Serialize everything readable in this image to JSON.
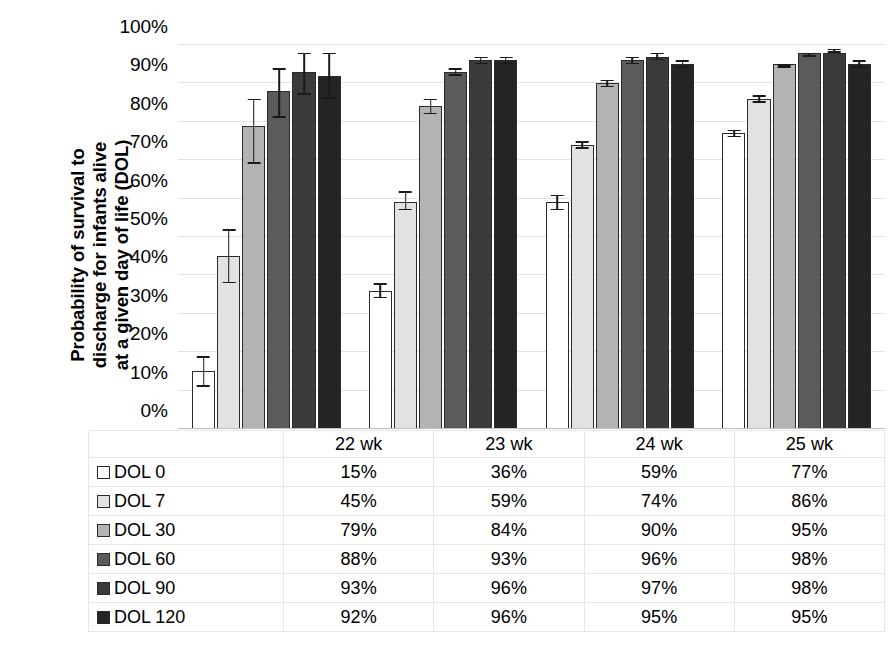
{
  "chart_data": {
    "type": "bar",
    "title": "",
    "xlabel": "",
    "ylabel": "Probability of survival to discharge for infants alive at a given day of life (DOL)",
    "ylabel_lines": [
      "Probability of survival to",
      "discharge for infants alive",
      "at a given day of life (DOL)"
    ],
    "categories": [
      "22 wk",
      "23 wk",
      "24 wk",
      "25 wk"
    ],
    "ylim": [
      0,
      100
    ],
    "y_unit": "%",
    "y_ticks": [
      0,
      10,
      20,
      30,
      40,
      50,
      60,
      70,
      80,
      90,
      100
    ],
    "y_tick_labels": [
      "0%",
      "10%",
      "20%",
      "30%",
      "40%",
      "50%",
      "60%",
      "70%",
      "80%",
      "90%",
      "100%"
    ],
    "grid": true,
    "legend_position": "table-left-column",
    "error_bars": "95% confidence interval",
    "series": [
      {
        "name": "DOL 0",
        "color": "#ffffff",
        "values": [
          15,
          36,
          59,
          77
        ],
        "labels": [
          "15%",
          "36%",
          "59%",
          "77%"
        ],
        "ci_low": [
          11,
          34,
          57,
          76
        ],
        "ci_high": [
          19,
          38,
          61,
          78
        ]
      },
      {
        "name": "DOL 7",
        "color": "#e2e2e2",
        "values": [
          45,
          59,
          74,
          86
        ],
        "labels": [
          "45%",
          "59%",
          "74%",
          "86%"
        ],
        "ci_low": [
          38,
          57,
          73,
          85
        ],
        "ci_high": [
          52,
          62,
          75,
          87
        ]
      },
      {
        "name": "DOL 30",
        "color": "#b3b3b3",
        "values": [
          79,
          84,
          90,
          95
        ],
        "labels": [
          "79%",
          "84%",
          "90%",
          "95%"
        ],
        "ci_low": [
          69,
          82,
          89,
          94
        ],
        "ci_high": [
          86,
          86,
          91,
          95
        ]
      },
      {
        "name": "DOL 60",
        "color": "#5b5b5b",
        "values": [
          88,
          93,
          96,
          98
        ],
        "labels": [
          "88%",
          "93%",
          "96%",
          "98%"
        ],
        "ci_low": [
          81,
          92,
          95,
          97
        ],
        "ci_high": [
          94,
          94,
          97,
          98
        ]
      },
      {
        "name": "DOL 90",
        "color": "#3b3b3b",
        "values": [
          93,
          96,
          97,
          98
        ],
        "labels": [
          "93%",
          "96%",
          "97%",
          "98%"
        ],
        "ci_low": [
          87,
          95,
          96,
          98
        ],
        "ci_high": [
          98,
          97,
          98,
          99
        ]
      },
      {
        "name": "DOL 120",
        "color": "#242424",
        "values": [
          92,
          96,
          95,
          95
        ],
        "labels": [
          "92%",
          "96%",
          "95%",
          "95%"
        ],
        "ci_low": [
          86,
          95,
          94,
          94
        ],
        "ci_high": [
          98,
          97,
          96,
          96
        ]
      }
    ]
  },
  "table": {
    "corner_label": "",
    "column_headers": [
      "22 wk",
      "23 wk",
      "24 wk",
      "25 wk"
    ],
    "rows": [
      {
        "label": "DOL 0",
        "swatch": "#ffffff",
        "values": [
          "15%",
          "36%",
          "59%",
          "77%"
        ]
      },
      {
        "label": "DOL 7",
        "swatch": "#e2e2e2",
        "values": [
          "45%",
          "59%",
          "74%",
          "86%"
        ]
      },
      {
        "label": "DOL 30",
        "swatch": "#b3b3b3",
        "values": [
          "79%",
          "84%",
          "90%",
          "95%"
        ]
      },
      {
        "label": "DOL 60",
        "swatch": "#5b5b5b",
        "values": [
          "88%",
          "93%",
          "96%",
          "98%"
        ]
      },
      {
        "label": "DOL 90",
        "swatch": "#3b3b3b",
        "values": [
          "93%",
          "96%",
          "97%",
          "98%"
        ]
      },
      {
        "label": "DOL 120",
        "swatch": "#242424",
        "values": [
          "92%",
          "96%",
          "95%",
          "95%"
        ]
      }
    ]
  },
  "colors": {
    "gridline": "#e3e3e3",
    "axis": "#bdbdbd",
    "bar_outline": "#2b2b2b",
    "error_bar": "#1a1a1a",
    "table_border": "#e6e6e6",
    "text": "#000000",
    "background": "#ffffff"
  }
}
